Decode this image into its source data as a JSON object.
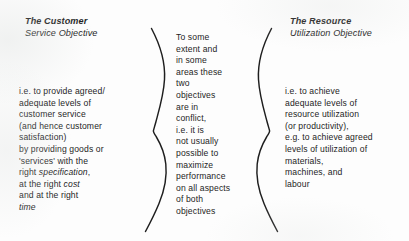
{
  "diagram": {
    "type": "two-objectives-brace-diagram",
    "background_color": "#fdfdfd",
    "ink_color": "#1e1e1e"
  },
  "left": {
    "heading_line1": "The Customer",
    "heading_line2": "Service Objective",
    "body_lines": [
      "i.e. to provide agreed/",
      "adequate levels of",
      "customer service",
      "(and hence customer",
      "satisfaction)",
      "by providing goods or",
      "'services' with the",
      "right specification,",
      "at the right cost",
      "and at the right",
      "time"
    ]
  },
  "middle": {
    "body_lines": [
      "To some",
      "extent and",
      "in some",
      "areas these",
      "two",
      "objectives",
      "are in",
      "conflict,",
      "i.e. it is",
      "not usually",
      "possible to",
      "maximize",
      "performance",
      "on all aspects",
      "of both",
      "objectives"
    ]
  },
  "right": {
    "heading_line1": "The Resource",
    "heading_line2": "Utilization Objective",
    "body_lines": [
      "i.e. to achieve",
      "adequate levels of",
      "resource utilization",
      "(or productivity),",
      "e.g. to achieve agreed",
      "levels of utilization of",
      "materials,",
      "machines, and",
      "labour"
    ]
  },
  "braces": {
    "left_brace_label": "right-facing-curly-brace",
    "right_brace_label": "left-facing-curly-brace"
  }
}
